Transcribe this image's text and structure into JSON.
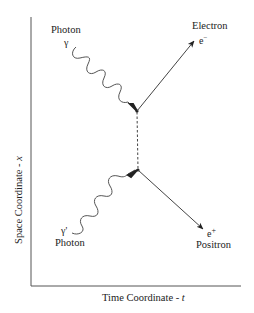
{
  "diagram": {
    "type": "Feynman diagram: pair production (two photons to electron-positron)",
    "axes": {
      "x_label": "Time Coordinate - ",
      "x_var": "t",
      "y_label": "Space Coordinate - ",
      "y_var": "x"
    },
    "particles": {
      "photon_in_1": {
        "name": "Photon",
        "symbol": "γ"
      },
      "photon_in_2": {
        "name": "Photon",
        "symbol": "γ'"
      },
      "electron_out": {
        "name": "Electron",
        "symbol": "e",
        "charge": "−"
      },
      "positron_out": {
        "name": "Positron",
        "symbol": "e",
        "charge": "+"
      }
    },
    "propagator": {
      "style": "dashed",
      "orientation": "vertical"
    },
    "colors": {
      "line": "#444444",
      "text": "#222222",
      "background": "#ffffff"
    }
  }
}
